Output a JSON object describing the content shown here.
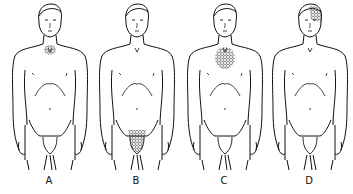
{
  "diagram": {
    "type": "anatomical-figures",
    "ink_color": "#111111",
    "background": "#ffffff",
    "figures": [
      {
        "label": "A",
        "highlight_region": "neck-base",
        "x": 5
      },
      {
        "label": "B",
        "highlight_region": "pubic-area",
        "x": 92
      },
      {
        "label": "C",
        "highlight_region": "upper-chest",
        "x": 180
      },
      {
        "label": "D",
        "highlight_region": "head-top-right",
        "x": 265
      }
    ]
  }
}
